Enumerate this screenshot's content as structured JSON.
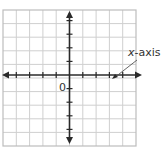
{
  "diagram": {
    "type": "coordinate-plane",
    "grid": {
      "columns": 10,
      "rows": 10
    },
    "axes": {
      "x_axis": {
        "has_arrows": true,
        "tick_count_each_side": 5
      },
      "y_axis": {
        "has_arrows": true,
        "tick_count_each_side": 5
      }
    },
    "origin_label": "0",
    "callout": {
      "label": "x-axis",
      "italic_part": "x",
      "rest_part": "-axis"
    },
    "colors": {
      "grid": "#cfcfcf",
      "axis": "#2a2a2a",
      "text": "#333333"
    }
  }
}
